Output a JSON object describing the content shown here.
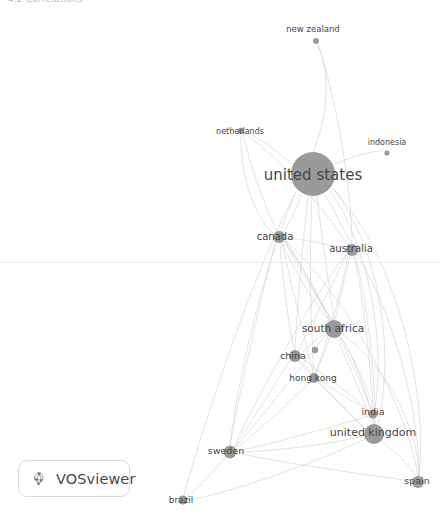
{
  "page": {
    "header_text": "4.2 Correlations",
    "background_color": "#ffffff"
  },
  "branding": {
    "badge_label": "VOSviewer",
    "logo_icon": "vosviewer-cluster-icon",
    "border_color": "#d9d9d9"
  },
  "network": {
    "title": "co-authorship network by country",
    "node_color": "#9a9a9a",
    "edge_color": "#c9c9c9",
    "label_color": "#464646",
    "nodes": [
      {
        "id": "new-zealand",
        "label": "new zealand",
        "x": 316,
        "y": 41,
        "r": 3.0,
        "label_x": 313,
        "label_y": 29,
        "font_size": 8.5
      },
      {
        "id": "netherlands",
        "label": "netherlands",
        "x": 241,
        "y": 131,
        "r": 3.2,
        "label_x": 240,
        "label_y": 131,
        "font_size": 8.0
      },
      {
        "id": "indonesia",
        "label": "indonesia",
        "x": 387,
        "y": 153,
        "r": 2.6,
        "label_x": 387,
        "label_y": 142,
        "font_size": 8.0
      },
      {
        "id": "united-states",
        "label": "united states",
        "x": 313,
        "y": 174,
        "r": 22.0,
        "label_x": 313,
        "label_y": 175,
        "font_size": 15.0
      },
      {
        "id": "canada",
        "label": "canada",
        "x": 279,
        "y": 237,
        "r": 6.0,
        "label_x": 275,
        "label_y": 237,
        "font_size": 10.0
      },
      {
        "id": "australia",
        "label": "australia",
        "x": 352,
        "y": 250,
        "r": 6.0,
        "label_x": 351,
        "label_y": 249,
        "font_size": 10.0
      },
      {
        "id": "south-africa",
        "label": "south africa",
        "x": 334,
        "y": 329,
        "r": 9.0,
        "label_x": 333,
        "label_y": 329,
        "font_size": 10.5
      },
      {
        "id": "unlabeled-node",
        "label": "",
        "x": 315,
        "y": 350,
        "r": 3.2,
        "label_x": 315,
        "label_y": 350,
        "font_size": 0
      },
      {
        "id": "china",
        "label": "china",
        "x": 295,
        "y": 356,
        "r": 6.0,
        "label_x": 293,
        "label_y": 356,
        "font_size": 9.5
      },
      {
        "id": "hong-kong",
        "label": "hong kong",
        "x": 314,
        "y": 378,
        "r": 5.0,
        "label_x": 313,
        "label_y": 378,
        "font_size": 9.0
      },
      {
        "id": "india",
        "label": "india",
        "x": 373,
        "y": 414,
        "r": 4.5,
        "label_x": 373,
        "label_y": 412,
        "font_size": 9.5
      },
      {
        "id": "united-kingdom",
        "label": "united kingdom",
        "x": 374,
        "y": 434,
        "r": 10.0,
        "label_x": 373,
        "label_y": 433,
        "font_size": 11.0
      },
      {
        "id": "sweden",
        "label": "sweden",
        "x": 230,
        "y": 452,
        "r": 6.5,
        "label_x": 226,
        "label_y": 451,
        "font_size": 9.5
      },
      {
        "id": "spain",
        "label": "spain",
        "x": 418,
        "y": 482,
        "r": 6.0,
        "label_x": 417,
        "label_y": 481,
        "font_size": 9.5
      },
      {
        "id": "brazil",
        "label": "brazil",
        "x": 183,
        "y": 500,
        "r": 4.5,
        "label_x": 181,
        "label_y": 500,
        "font_size": 9.0
      }
    ],
    "edges": [
      {
        "source": "united-states",
        "target": "new-zealand",
        "path": "M 313 152 C 330 110 330 70 317 44"
      },
      {
        "source": "united-states",
        "target": "netherlands",
        "path": "M 292 164 C 272 148 258 136 244 132"
      },
      {
        "source": "united-states",
        "target": "indonesia",
        "path": "M 335 164 C 355 156 372 150 386 151"
      },
      {
        "source": "united-states",
        "target": "canada",
        "path": "M 302 194 C 296 210 288 226 281 234"
      },
      {
        "source": "united-states",
        "target": "australia",
        "path": "M 325 194 C 335 212 346 234 352 245"
      },
      {
        "source": "united-states",
        "target": "south-africa",
        "path": "M 317 196 C 322 240 330 290 334 320"
      },
      {
        "source": "united-states",
        "target": "china",
        "path": "M 308 196 C 302 250 297 310 295 350"
      },
      {
        "source": "united-states",
        "target": "hong-kong",
        "path": "M 312 196 C 309 260 311 330 314 373"
      },
      {
        "source": "united-states",
        "target": "india",
        "path": "M 330 190 C 370 250 385 340 375 409"
      },
      {
        "source": "united-states",
        "target": "united-kingdom",
        "path": "M 333 188 C 380 250 395 350 378 424"
      },
      {
        "source": "united-states",
        "target": "sweden",
        "path": "M 296 192 C 262 270 238 380 230 445"
      },
      {
        "source": "united-states",
        "target": "spain",
        "path": "M 334 190 C 400 260 428 400 419 476"
      },
      {
        "source": "united-states",
        "target": "brazil",
        "path": "M 295 194 C 250 280 205 420 184 495"
      },
      {
        "source": "canada",
        "target": "south-africa",
        "path": "M 284 241 C 300 270 322 305 332 320"
      },
      {
        "source": "canada",
        "target": "china",
        "path": "M 280 243 C 282 280 290 330 294 350"
      },
      {
        "source": "canada",
        "target": "hong-kong",
        "path": "M 282 242 C 292 290 308 350 313 373"
      },
      {
        "source": "canada",
        "target": "united-kingdom",
        "path": "M 285 240 C 320 290 360 390 372 424"
      },
      {
        "source": "canada",
        "target": "india",
        "path": "M 284 241 C 318 285 358 375 371 409"
      },
      {
        "source": "canada",
        "target": "sweden",
        "path": "M 275 243 C 258 310 238 400 230 445"
      },
      {
        "source": "canada",
        "target": "australia",
        "path": "M 285 238 C 310 240 335 246 346 249"
      },
      {
        "source": "canada",
        "target": "spain",
        "path": "M 285 240 C 340 290 406 400 418 476"
      },
      {
        "source": "australia",
        "target": "south-africa",
        "path": "M 350 256 C 344 280 338 310 335 320"
      },
      {
        "source": "australia",
        "target": "china",
        "path": "M 347 254 C 330 290 305 335 298 351"
      },
      {
        "source": "australia",
        "target": "hong-kong",
        "path": "M 348 255 C 340 300 322 355 316 373"
      },
      {
        "source": "australia",
        "target": "india",
        "path": "M 354 256 C 364 300 372 380 373 409"
      },
      {
        "source": "australia",
        "target": "united-kingdom",
        "path": "M 355 256 C 368 300 376 390 375 424"
      },
      {
        "source": "australia",
        "target": "sweden",
        "path": "M 346 254 C 310 300 250 410 234 447"
      },
      {
        "source": "australia",
        "target": "spain",
        "path": "M 357 255 C 392 310 420 410 419 476"
      },
      {
        "source": "australia",
        "target": "netherlands",
        "path": "M 347 245 C 320 200 270 150 244 133"
      },
      {
        "source": "south-africa",
        "target": "china",
        "path": "M 325 333 C 315 340 305 350 301 354"
      },
      {
        "source": "south-africa",
        "target": "hong-kong",
        "path": "M 330 337 C 325 352 318 368 315 373"
      },
      {
        "source": "south-africa",
        "target": "india",
        "path": "M 340 336 C 356 360 370 395 373 409"
      },
      {
        "source": "south-africa",
        "target": "united-kingdom",
        "path": "M 341 337 C 358 365 372 410 374 424"
      },
      {
        "source": "south-africa",
        "target": "sweden",
        "path": "M 326 334 C 300 370 250 430 235 448"
      },
      {
        "source": "south-africa",
        "target": "spain",
        "path": "M 342 334 C 390 370 418 430 419 476"
      },
      {
        "source": "china",
        "target": "hong-kong",
        "path": "M 298 361 C 304 368 310 374 312 376"
      },
      {
        "source": "china",
        "target": "india",
        "path": "M 301 358 C 325 375 358 400 369 411"
      },
      {
        "source": "china",
        "target": "united-kingdom",
        "path": "M 300 360 C 322 385 356 420 366 430"
      },
      {
        "source": "china",
        "target": "sweden",
        "path": "M 290 360 C 272 390 244 432 234 448"
      },
      {
        "source": "hong-kong",
        "target": "india",
        "path": "M 319 380 C 336 391 360 406 369 411"
      },
      {
        "source": "hong-kong",
        "target": "united-kingdom",
        "path": "M 318 382 C 334 398 358 422 366 429"
      },
      {
        "source": "hong-kong",
        "target": "sweden",
        "path": "M 310 382 C 290 402 250 438 236 449"
      },
      {
        "source": "india",
        "target": "united-kingdom",
        "path": "M 373 419 C 374 422 374 426 374 424"
      },
      {
        "source": "india",
        "target": "sweden",
        "path": "M 369 416 C 330 428 262 446 237 451"
      },
      {
        "source": "united-kingdom",
        "target": "sweden",
        "path": "M 364 436 C 322 446 262 452 237 452"
      },
      {
        "source": "united-kingdom",
        "target": "spain",
        "path": "M 381 441 C 398 452 412 470 416 476"
      },
      {
        "source": "united-kingdom",
        "target": "brazil",
        "path": "M 365 439 C 300 470 220 495 188 500"
      },
      {
        "source": "sweden",
        "target": "brazil",
        "path": "M 226 457 C 212 472 194 492 186 498"
      },
      {
        "source": "sweden",
        "target": "spain",
        "path": "M 236 453 C 300 466 390 478 412 481"
      },
      {
        "source": "netherlands",
        "target": "canada",
        "path": "M 241 135 C 240 170 252 215 274 234"
      },
      {
        "source": "netherlands",
        "target": "south-africa",
        "path": "M 243 134 C 258 200 300 290 330 321"
      },
      {
        "source": "new-zealand",
        "target": "australia",
        "path": "M 318 44 C 340 110 352 200 352 243"
      }
    ]
  }
}
